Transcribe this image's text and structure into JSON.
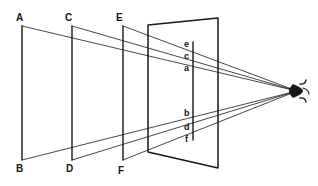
{
  "figure": {
    "type": "perspective-projection-diagram",
    "stroke_color": "#1a1714",
    "background_color": "#ffffff"
  },
  "labels": {
    "object_planes": [
      {
        "id": "A",
        "text": "A",
        "x": 16,
        "y": 13
      },
      {
        "id": "B",
        "text": "B",
        "x": 16,
        "y": 164
      },
      {
        "id": "C",
        "text": "C",
        "x": 65,
        "y": 13
      },
      {
        "id": "D",
        "text": "D",
        "x": 66,
        "y": 164
      },
      {
        "id": "E",
        "text": "E",
        "x": 116,
        "y": 13
      },
      {
        "id": "F",
        "text": "F",
        "x": 118,
        "y": 166
      }
    ],
    "picture_plane_points": [
      {
        "id": "e",
        "text": "e",
        "x": 184,
        "y": 40
      },
      {
        "id": "c",
        "text": "c",
        "x": 184,
        "y": 52
      },
      {
        "id": "a",
        "text": "a",
        "x": 184,
        "y": 64
      },
      {
        "id": "b",
        "text": "b",
        "x": 184,
        "y": 109
      },
      {
        "id": "d",
        "text": "d",
        "x": 184,
        "y": 123
      },
      {
        "id": "f",
        "text": "f",
        "x": 185,
        "y": 135
      }
    ]
  },
  "geometry": {
    "vertical_lines": [
      {
        "name": "line-AB",
        "x": 22,
        "y_top": 26,
        "y_bottom": 160
      },
      {
        "name": "line-CD",
        "x": 72,
        "y_top": 26,
        "y_bottom": 160
      },
      {
        "name": "line-EF",
        "x": 123,
        "y_top": 26,
        "y_bottom": 160
      },
      {
        "name": "picture-plane-point-line",
        "x": 193,
        "y_top": 42,
        "y_bottom": 140
      }
    ],
    "picture_plane": {
      "name": "picture-plane-quad",
      "top_left": [
        148,
        25
      ],
      "top_right": [
        218,
        18
      ],
      "bottom_right": [
        218,
        168
      ],
      "bottom_left": [
        148,
        152
      ]
    },
    "eye": {
      "name": "eye",
      "x": 297,
      "y": 91
    },
    "rays": [
      {
        "from": "A",
        "to": "eye",
        "through": "a"
      },
      {
        "from": "C",
        "to": "eye",
        "through": "c"
      },
      {
        "from": "E",
        "to": "eye",
        "through": "e"
      },
      {
        "from": "B",
        "to": "eye",
        "through": "b"
      },
      {
        "from": "D",
        "to": "eye",
        "through": "d"
      },
      {
        "from": "F",
        "to": "eye",
        "through": "f"
      }
    ]
  }
}
